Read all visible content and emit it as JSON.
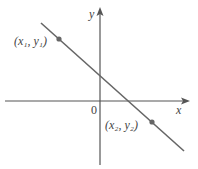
{
  "diagram": {
    "type": "coordinate-plane-line",
    "axes": {
      "x_label": "x",
      "y_label": "y",
      "origin_label": "0",
      "color": "#555555"
    },
    "line": {
      "color": "#666666",
      "description": "straight line with negative slope crossing both axes"
    },
    "points": [
      {
        "label": "(x₁, y₁)",
        "color": "#666666"
      },
      {
        "label": "(x₂, y₂)",
        "color": "#666666"
      }
    ]
  }
}
